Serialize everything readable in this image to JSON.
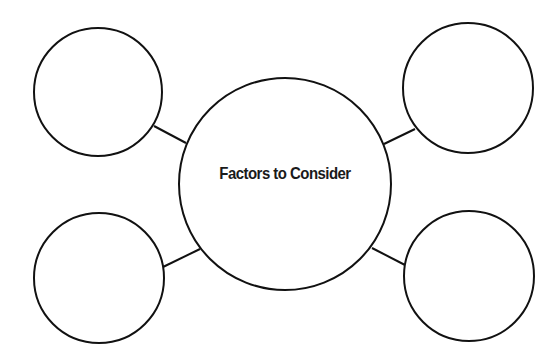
{
  "diagram": {
    "type": "concept-web",
    "center": {
      "label": "Factors to Consider",
      "cx": 285,
      "cy": 184,
      "r": 106
    },
    "outer_nodes": [
      {
        "id": "top-left",
        "label": "",
        "cx": 98,
        "cy": 92,
        "r": 64
      },
      {
        "id": "top-right",
        "label": "",
        "cx": 468,
        "cy": 88,
        "r": 65
      },
      {
        "id": "bottom-left",
        "label": "",
        "cx": 99,
        "cy": 278,
        "r": 65
      },
      {
        "id": "bottom-right",
        "label": "",
        "cx": 469,
        "cy": 276,
        "r": 65
      }
    ],
    "connectors": [
      {
        "from": "top-left",
        "to": "center",
        "x1": 154,
        "y1": 126,
        "x2": 186,
        "y2": 143
      },
      {
        "from": "top-right",
        "to": "center",
        "x1": 415,
        "y1": 129,
        "x2": 384,
        "y2": 144
      },
      {
        "from": "bottom-left",
        "to": "center",
        "x1": 163,
        "y1": 267,
        "x2": 200,
        "y2": 249
      },
      {
        "from": "bottom-right",
        "to": "center",
        "x1": 405,
        "y1": 265,
        "x2": 372,
        "y2": 248
      }
    ],
    "colors": {
      "stroke": "#111111",
      "fill": "#ffffff",
      "text": "#1a1a1a"
    }
  }
}
